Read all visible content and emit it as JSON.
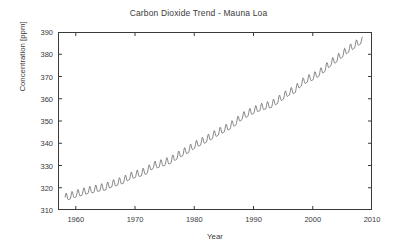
{
  "chart_data": {
    "type": "line",
    "title": "Carbon Dioxide Trend - Mauna Loa",
    "xlabel": "Year",
    "ylabel": "Concentration [ppm]",
    "xlim": [
      1957,
      2010
    ],
    "ylim": [
      310,
      390
    ],
    "xticks": [
      1960,
      1970,
      1980,
      1990,
      2000,
      2010
    ],
    "xticklabels": [
      "1960",
      "1970",
      "1980",
      "1990",
      "2000",
      "2010"
    ],
    "yticks": [
      310,
      320,
      330,
      340,
      350,
      360,
      370,
      380,
      390
    ],
    "yticklabels": [
      "310",
      "320",
      "330",
      "340",
      "350",
      "360",
      "370",
      "380",
      "390"
    ],
    "grid": false,
    "legend": null,
    "line_color": "#555555",
    "line_width": 0.7,
    "series": [
      {
        "name": "Monthly mean CO2 (Mauna Loa)",
        "description": "Keeling Curve: rising annual trend with seasonal sawtooth oscillation of roughly 3 ppm peak-to-trough, maxima in May and minima in September.",
        "x_start": 1958.2,
        "x_end": 2008.4,
        "samples_per_year": 12,
        "annual_means": [
          {
            "year": 1958,
            "value": 315.3
          },
          {
            "year": 1959,
            "value": 315.9
          },
          {
            "year": 1960,
            "value": 316.9
          },
          {
            "year": 1961,
            "value": 317.6
          },
          {
            "year": 1962,
            "value": 318.4
          },
          {
            "year": 1963,
            "value": 318.9
          },
          {
            "year": 1964,
            "value": 319.6
          },
          {
            "year": 1965,
            "value": 320.0
          },
          {
            "year": 1966,
            "value": 321.3
          },
          {
            "year": 1967,
            "value": 322.1
          },
          {
            "year": 1968,
            "value": 323.0
          },
          {
            "year": 1969,
            "value": 324.6
          },
          {
            "year": 1970,
            "value": 325.6
          },
          {
            "year": 1971,
            "value": 326.3
          },
          {
            "year": 1972,
            "value": 327.4
          },
          {
            "year": 1973,
            "value": 329.7
          },
          {
            "year": 1974,
            "value": 330.2
          },
          {
            "year": 1975,
            "value": 331.1
          },
          {
            "year": 1976,
            "value": 332.0
          },
          {
            "year": 1977,
            "value": 333.8
          },
          {
            "year": 1978,
            "value": 335.4
          },
          {
            "year": 1979,
            "value": 336.8
          },
          {
            "year": 1980,
            "value": 338.7
          },
          {
            "year": 1981,
            "value": 340.1
          },
          {
            "year": 1982,
            "value": 341.4
          },
          {
            "year": 1983,
            "value": 343.0
          },
          {
            "year": 1984,
            "value": 344.6
          },
          {
            "year": 1985,
            "value": 346.0
          },
          {
            "year": 1986,
            "value": 347.4
          },
          {
            "year": 1987,
            "value": 349.2
          },
          {
            "year": 1988,
            "value": 351.6
          },
          {
            "year": 1989,
            "value": 353.1
          },
          {
            "year": 1990,
            "value": 354.4
          },
          {
            "year": 1991,
            "value": 355.6
          },
          {
            "year": 1992,
            "value": 356.4
          },
          {
            "year": 1993,
            "value": 357.1
          },
          {
            "year": 1994,
            "value": 358.8
          },
          {
            "year": 1995,
            "value": 360.8
          },
          {
            "year": 1996,
            "value": 362.6
          },
          {
            "year": 1997,
            "value": 363.7
          },
          {
            "year": 1998,
            "value": 366.7
          },
          {
            "year": 1999,
            "value": 368.4
          },
          {
            "year": 2000,
            "value": 369.5
          },
          {
            "year": 2001,
            "value": 371.1
          },
          {
            "year": 2002,
            "value": 373.2
          },
          {
            "year": 2003,
            "value": 375.8
          },
          {
            "year": 2004,
            "value": 377.5
          },
          {
            "year": 2005,
            "value": 379.8
          },
          {
            "year": 2006,
            "value": 381.9
          },
          {
            "year": 2007,
            "value": 383.7
          },
          {
            "year": 2008,
            "value": 385.6
          }
        ],
        "seasonal_amplitude_ppm": 3.1,
        "seasonal_peak_month": 5,
        "seasonal_trough_month": 9
      }
    ]
  }
}
